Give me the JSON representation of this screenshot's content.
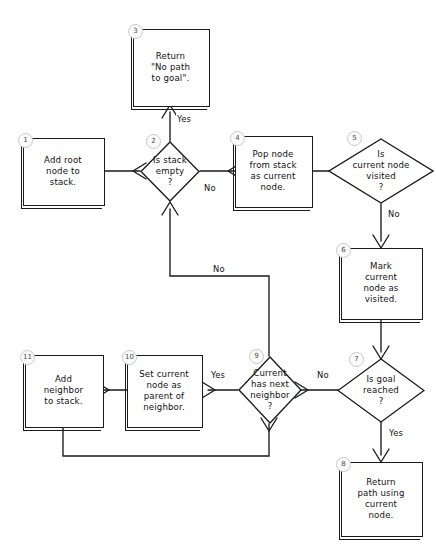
{
  "diagram": {
    "style": {
      "stroke": "#1a1a1a",
      "background": "#ffffff",
      "badge_fill": "#fbfbfb",
      "badge_stroke": "#c9c9c9"
    }
  },
  "nodes": [
    {
      "id": "1",
      "shape": "process",
      "text": "Add root\nnode to\nstack."
    },
    {
      "id": "2",
      "shape": "decision",
      "text": "Is stack\nempty\n?"
    },
    {
      "id": "3",
      "shape": "process",
      "text": "Return\n\"No path\nto goal\"."
    },
    {
      "id": "4",
      "shape": "process",
      "text": "Pop node\nfrom stack\nas current\nnode."
    },
    {
      "id": "5",
      "shape": "decision",
      "text": "Is\ncurrent node\nvisited\n?"
    },
    {
      "id": "6",
      "shape": "process",
      "text": "Mark\ncurrent\nnode as\nvisited."
    },
    {
      "id": "7",
      "shape": "decision",
      "text": "Is goal\nreached\n?"
    },
    {
      "id": "8",
      "shape": "process",
      "text": "Return\npath using\ncurrent\nnode."
    },
    {
      "id": "9",
      "shape": "decision",
      "text": "Current\nhas next\nneighbor\n?"
    },
    {
      "id": "10",
      "shape": "process",
      "text": "Set current\nnode as\nparent of\nneighbor."
    },
    {
      "id": "11",
      "shape": "process",
      "text": "Add\nneighbor\nto stack."
    }
  ],
  "edge_labels": {
    "yes_2_to_3": "Yes",
    "no_2_to_4": "No",
    "no_5_to_6": "No",
    "no_9_to_2": "No",
    "no_7_to_9": "No",
    "yes_7_to_8": "Yes",
    "yes_9_to_10": "Yes"
  }
}
